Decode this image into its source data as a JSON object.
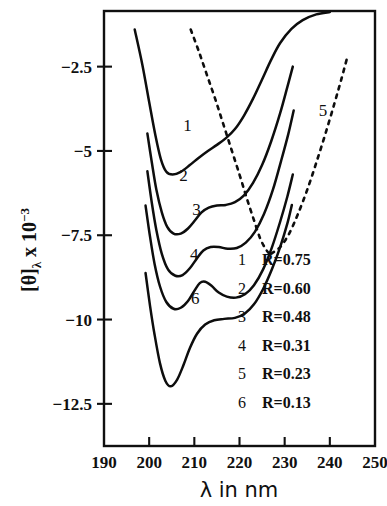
{
  "chart_data": {
    "type": "line",
    "title": "",
    "xlabel": "λ in nm",
    "ylabel": "[θ]λ x 10-3",
    "ylabel_base": "[θ]",
    "ylabel_sub": "λ",
    "ylabel_mid": " x 10",
    "ylabel_sup": "-3",
    "xlim": [
      190,
      250
    ],
    "ylim": [
      -13.75,
      -0.85
    ],
    "xticks": [
      190,
      200,
      210,
      220,
      230,
      240,
      250
    ],
    "xtick_labels": [
      "190",
      "200",
      "210",
      "220",
      "230",
      "240",
      "250"
    ],
    "yticks": [
      -2.5,
      -5,
      -7.5,
      -10,
      -12.5
    ],
    "ytick_labels": [
      "-2.5",
      "-5",
      "-7.5",
      "-10",
      "-12.5"
    ],
    "grid": false,
    "legend_position": "inside-lower-right",
    "series": [
      {
        "name": "1",
        "label": "R=0.75",
        "style": "solid",
        "points": [
          [
            196.8,
            -1.4
          ],
          [
            198.5,
            -2.45
          ],
          [
            200.0,
            -3.55
          ],
          [
            201.4,
            -4.55
          ],
          [
            202.6,
            -5.25
          ],
          [
            203.8,
            -5.62
          ],
          [
            205.2,
            -5.7
          ],
          [
            207.0,
            -5.62
          ],
          [
            209.0,
            -5.42
          ],
          [
            211.0,
            -5.2
          ],
          [
            213.0,
            -5.0
          ],
          [
            215.0,
            -4.82
          ],
          [
            217.0,
            -4.62
          ],
          [
            219.0,
            -4.35
          ],
          [
            221.0,
            -3.95
          ],
          [
            223.0,
            -3.45
          ],
          [
            225.0,
            -2.88
          ],
          [
            227.0,
            -2.3
          ],
          [
            229.0,
            -1.8
          ],
          [
            231.5,
            -1.38
          ],
          [
            234.0,
            -1.12
          ],
          [
            237.0,
            -0.95
          ],
          [
            240.0,
            -0.88
          ]
        ]
      },
      {
        "name": "2",
        "label": "R=0.60",
        "style": "solid",
        "points": [
          [
            199.6,
            -4.48
          ],
          [
            200.6,
            -5.35
          ],
          [
            201.6,
            -6.15
          ],
          [
            202.8,
            -6.82
          ],
          [
            204.0,
            -7.25
          ],
          [
            205.4,
            -7.45
          ],
          [
            207.0,
            -7.45
          ],
          [
            208.6,
            -7.3
          ],
          [
            210.2,
            -7.05
          ],
          [
            211.6,
            -6.82
          ],
          [
            213.2,
            -6.68
          ],
          [
            215.0,
            -6.62
          ],
          [
            217.0,
            -6.6
          ],
          [
            219.0,
            -6.52
          ],
          [
            221.0,
            -6.32
          ],
          [
            223.0,
            -5.95
          ],
          [
            225.0,
            -5.42
          ],
          [
            227.0,
            -4.72
          ],
          [
            229.0,
            -3.88
          ],
          [
            230.6,
            -3.1
          ],
          [
            231.8,
            -2.5
          ]
        ]
      },
      {
        "name": "3",
        "label": "R=0.48",
        "style": "solid",
        "points": [
          [
            199.6,
            -5.6
          ],
          [
            200.6,
            -6.55
          ],
          [
            201.6,
            -7.35
          ],
          [
            202.8,
            -8.05
          ],
          [
            204.2,
            -8.52
          ],
          [
            205.8,
            -8.7
          ],
          [
            207.4,
            -8.68
          ],
          [
            209.0,
            -8.48
          ],
          [
            210.6,
            -8.18
          ],
          [
            212.0,
            -7.95
          ],
          [
            213.6,
            -7.85
          ],
          [
            215.4,
            -7.85
          ],
          [
            217.4,
            -7.9
          ],
          [
            219.4,
            -7.88
          ],
          [
            221.4,
            -7.72
          ],
          [
            223.4,
            -7.4
          ],
          [
            225.4,
            -6.88
          ],
          [
            227.4,
            -6.15
          ],
          [
            229.2,
            -5.3
          ],
          [
            230.8,
            -4.5
          ],
          [
            232.0,
            -3.8
          ]
        ]
      },
      {
        "name": "4",
        "label": "R=0.31",
        "style": "solid",
        "points": [
          [
            199.2,
            -6.62
          ],
          [
            200.2,
            -7.55
          ],
          [
            201.2,
            -8.35
          ],
          [
            202.4,
            -9.02
          ],
          [
            203.8,
            -9.48
          ],
          [
            205.4,
            -9.68
          ],
          [
            207.0,
            -9.65
          ],
          [
            208.6,
            -9.45
          ],
          [
            210.0,
            -9.15
          ],
          [
            211.2,
            -8.92
          ],
          [
            212.4,
            -8.88
          ],
          [
            213.8,
            -9.0
          ],
          [
            215.4,
            -9.2
          ],
          [
            217.2,
            -9.32
          ],
          [
            219.2,
            -9.35
          ],
          [
            221.2,
            -9.25
          ],
          [
            223.2,
            -8.98
          ],
          [
            225.2,
            -8.52
          ],
          [
            227.2,
            -7.85
          ],
          [
            229.0,
            -7.1
          ],
          [
            230.6,
            -6.35
          ],
          [
            231.8,
            -5.7
          ]
        ]
      },
      {
        "name": "5",
        "label": "R=0.23",
        "style": "dashed",
        "points": [
          [
            227.0,
            -8.05
          ],
          [
            229.0,
            -7.85
          ],
          [
            231.0,
            -7.45
          ],
          [
            233.0,
            -6.85
          ],
          [
            235.0,
            -6.15
          ],
          [
            237.0,
            -5.35
          ],
          [
            239.0,
            -4.5
          ],
          [
            241.0,
            -3.6
          ],
          [
            242.6,
            -2.85
          ],
          [
            243.8,
            -2.25
          ]
        ]
      },
      {
        "name": "5b",
        "label": "R=0.23 (upper branch)",
        "style": "dashed",
        "points": [
          [
            209.2,
            -1.4
          ],
          [
            211.0,
            -2.05
          ],
          [
            212.8,
            -2.75
          ],
          [
            214.6,
            -3.45
          ],
          [
            216.4,
            -4.2
          ],
          [
            218.2,
            -4.95
          ],
          [
            220.0,
            -5.7
          ],
          [
            221.6,
            -6.4
          ],
          [
            223.2,
            -7.05
          ],
          [
            224.6,
            -7.6
          ],
          [
            226.0,
            -7.95
          ],
          [
            227.2,
            -8.12
          ]
        ]
      },
      {
        "name": "6",
        "label": "R=0.13",
        "style": "solid",
        "points": [
          [
            199.2,
            -8.62
          ],
          [
            200.2,
            -9.6
          ],
          [
            201.2,
            -10.45
          ],
          [
            202.4,
            -11.3
          ],
          [
            203.6,
            -11.82
          ],
          [
            204.8,
            -11.98
          ],
          [
            206.2,
            -11.78
          ],
          [
            207.6,
            -11.35
          ],
          [
            209.0,
            -10.85
          ],
          [
            210.6,
            -10.42
          ],
          [
            212.4,
            -10.15
          ],
          [
            214.4,
            -10.02
          ],
          [
            216.6,
            -9.98
          ],
          [
            219.0,
            -9.95
          ],
          [
            221.2,
            -9.82
          ],
          [
            223.2,
            -9.55
          ],
          [
            225.2,
            -9.1
          ],
          [
            227.2,
            -8.5
          ],
          [
            229.0,
            -7.85
          ],
          [
            230.6,
            -7.15
          ],
          [
            231.6,
            -6.6
          ]
        ]
      }
    ],
    "curve_annotations": [
      {
        "text": "1",
        "x": 208.5,
        "y": -4.42
      },
      {
        "text": "2",
        "x": 207.6,
        "y": -5.88
      },
      {
        "text": "3",
        "x": 210.5,
        "y": -6.9
      },
      {
        "text": "4",
        "x": 210.0,
        "y": -8.22
      },
      {
        "text": "6",
        "x": 210.2,
        "y": -9.55
      },
      {
        "text": "5",
        "x": 238.5,
        "y": -3.95
      }
    ],
    "legend_entries": [
      {
        "index": "1",
        "value": "R=0.75"
      },
      {
        "index": "2",
        "value": "R=0.60"
      },
      {
        "index": "3",
        "value": "R=0.48"
      },
      {
        "index": "4",
        "value": "R=0.31"
      },
      {
        "index": "5",
        "value": "R=0.23"
      },
      {
        "index": "6",
        "value": "R=0.13"
      }
    ]
  }
}
